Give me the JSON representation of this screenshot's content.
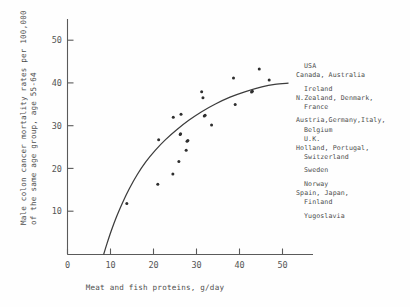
{
  "chart_data": {
    "type": "scatter",
    "title": "",
    "xlabel": "Meat and fish proteins, g/day",
    "ylabel_line1": "Male colon cancer mortality rates per 100,000",
    "ylabel_line2": "of the same age group, age 55-64",
    "xlim": [
      0,
      57
    ],
    "ylim": [
      0,
      55
    ],
    "xticks": [
      0,
      10,
      20,
      30,
      40,
      50
    ],
    "yticks": [
      10,
      20,
      30,
      40,
      50
    ],
    "grid": false,
    "legend_position": "right-outside",
    "x": [
      13.8,
      21.0,
      21.2,
      24.5,
      24.6,
      25.9,
      26.2,
      26.3,
      26.4,
      27.6,
      27.8,
      28.0,
      31.2,
      31.5,
      31.8,
      32.0,
      33.5,
      38.6,
      39.0,
      42.8,
      43.0,
      44.6,
      46.9
    ],
    "y": [
      11.9,
      16.4,
      26.8,
      18.8,
      32.0,
      21.7,
      28.0,
      28.2,
      32.7,
      24.3,
      26.4,
      26.6,
      38.0,
      36.6,
      32.3,
      32.5,
      30.2,
      41.2,
      35.0,
      37.9,
      38.1,
      43.3,
      40.7
    ],
    "series_name": "Country observations",
    "curve_description": "fitted monotone increasing saturating curve",
    "curve_points": [
      [
        8.4,
        0.0
      ],
      [
        9.2,
        2.6
      ],
      [
        10.2,
        5.6
      ],
      [
        11.4,
        8.8
      ],
      [
        12.8,
        12.1
      ],
      [
        14.4,
        15.4
      ],
      [
        16.2,
        18.6
      ],
      [
        18.2,
        21.6
      ],
      [
        20.4,
        24.3
      ],
      [
        22.8,
        26.8
      ],
      [
        25.4,
        29.1
      ],
      [
        28.2,
        31.3
      ],
      [
        31.2,
        33.3
      ],
      [
        34.4,
        35.1
      ],
      [
        37.8,
        36.7
      ],
      [
        41.4,
        38.0
      ],
      [
        45.2,
        39.1
      ],
      [
        48.2,
        39.7
      ],
      [
        51.4,
        40.0
      ]
    ]
  },
  "axes": {
    "x_tick_labels": [
      "0",
      "10",
      "20",
      "30",
      "40",
      "50"
    ],
    "y_tick_labels": [
      "10",
      "20",
      "30",
      "40",
      "50"
    ],
    "x_axis_title": "Meat and fish proteins, g/day",
    "y_axis_title_line_1": "Male colon cancer mortality rates per 100,000",
    "y_axis_title_line_2": "of the same age group, age 55-64"
  },
  "legend": {
    "groups": [
      {
        "lines": [
          {
            "text": "USA",
            "indent": 1
          },
          {
            "text": "Canada, Australia",
            "indent": 0
          }
        ]
      },
      {
        "lines": [
          {
            "text": "Ireland",
            "indent": 1
          },
          {
            "text": "N.Zealand, Denmark,",
            "indent": 0
          },
          {
            "text": "France",
            "indent": 1
          }
        ]
      },
      {
        "lines": [
          {
            "text": "Austria,Germany,Italy,",
            "indent": 0
          },
          {
            "text": "Belgium",
            "indent": 1
          },
          {
            "text": "U.K.",
            "indent": 1
          },
          {
            "text": "Holland, Portugal,",
            "indent": 0
          },
          {
            "text": "Switzerland",
            "indent": 1
          }
        ]
      },
      {
        "lines": [
          {
            "text": "Sweden",
            "indent": 1
          }
        ]
      },
      {
        "lines": [
          {
            "text": "Norway",
            "indent": 1
          },
          {
            "text": "Spain, Japan,",
            "indent": 0
          },
          {
            "text": "Finland",
            "indent": 1
          }
        ]
      },
      {
        "lines": [
          {
            "text": "Yugoslavia",
            "indent": 1
          }
        ]
      }
    ]
  },
  "colors": {
    "background": "#fefefe",
    "axis": "#5a5a5a",
    "curve": "#3c3c3c",
    "point": "#2e2e2e",
    "text": "#4d4d4d"
  }
}
